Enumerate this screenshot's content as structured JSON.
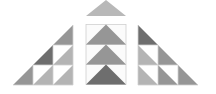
{
  "figure": {
    "colors": {
      "dark": "#6e6e6e",
      "medium": "#969696",
      "light": "#b4b4b4",
      "top": "#b8b8b8",
      "white": "#ffffff",
      "grid": "#d0d0d0"
    },
    "left_staircase": {
      "cells": [
        {
          "row": 0,
          "col": 2,
          "fill": "medium",
          "half": "lower-right"
        },
        {
          "row": 1,
          "col": 1,
          "fill": "dark",
          "half": "lower-right"
        },
        {
          "row": 1,
          "col": 2,
          "fill": "light",
          "half": "lower-right",
          "other": "white"
        },
        {
          "row": 2,
          "col": 0,
          "fill": "medium",
          "half": "lower-right"
        },
        {
          "row": 2,
          "col": 1,
          "fill": "light",
          "half": "lower-right",
          "other": "white"
        },
        {
          "row": 2,
          "col": 2,
          "fill": "light",
          "half": "lower-right",
          "other": "white"
        }
      ]
    },
    "center_column": {
      "top_triangle": "top",
      "rows": [
        "medium",
        "medium",
        "dark"
      ]
    },
    "right_staircase": {
      "cells": [
        {
          "row": 0,
          "col": 0,
          "fill": "dark",
          "half": "lower-left"
        },
        {
          "row": 1,
          "col": 0,
          "fill": "light",
          "half": "lower-left",
          "other": "white"
        },
        {
          "row": 1,
          "col": 1,
          "fill": "medium",
          "half": "lower-left"
        },
        {
          "row": 2,
          "col": 0,
          "fill": "light",
          "half": "lower-left",
          "other": "white"
        },
        {
          "row": 2,
          "col": 1,
          "fill": "medium",
          "half": "lower-left",
          "other": "white"
        },
        {
          "row": 2,
          "col": 2,
          "fill": "medium",
          "half": "lower-left"
        }
      ]
    }
  }
}
